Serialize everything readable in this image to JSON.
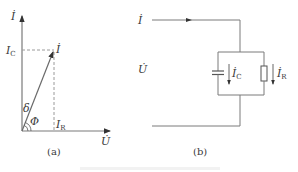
{
  "figure": {
    "panel_a": {
      "caption": "(a)",
      "labels": {
        "y_axis": "İ",
        "x_axis": "U̇",
        "current": "İ",
        "ic": "I",
        "ic_sub": "C",
        "ir": "I",
        "ir_sub": "R",
        "delta": "δ",
        "phi": "Φ"
      }
    },
    "panel_b": {
      "caption": "(b)",
      "labels": {
        "input_current": "İ",
        "voltage": "U̇",
        "ic": "İ",
        "ic_sub": "C",
        "ir": "İ",
        "ir_sub": "R"
      },
      "components": [
        "capacitor",
        "resistor"
      ]
    },
    "colors": {
      "line": "#7a7a7a",
      "dashed": "#9a9a9a",
      "text": "#3a3a3a"
    }
  }
}
